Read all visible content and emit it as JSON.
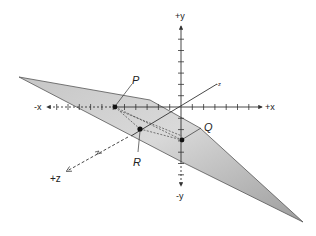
{
  "diagram": {
    "type": "3d-coordinate-plane",
    "axes": {
      "pos_x": "+x",
      "neg_x": "-x",
      "pos_y": "+y",
      "neg_y": "-y",
      "pos_z": "+z",
      "neg_z": "-z"
    },
    "points": [
      {
        "id": "P",
        "label": "P"
      },
      {
        "id": "Q",
        "label": "Q"
      },
      {
        "id": "R",
        "label": "R"
      }
    ],
    "colors": {
      "plane_fill_light": "#e2e2e2",
      "plane_fill_dark": "#a8a8a8",
      "plane_stroke": "#555555",
      "axis": "#333333",
      "point": "#111111"
    }
  }
}
